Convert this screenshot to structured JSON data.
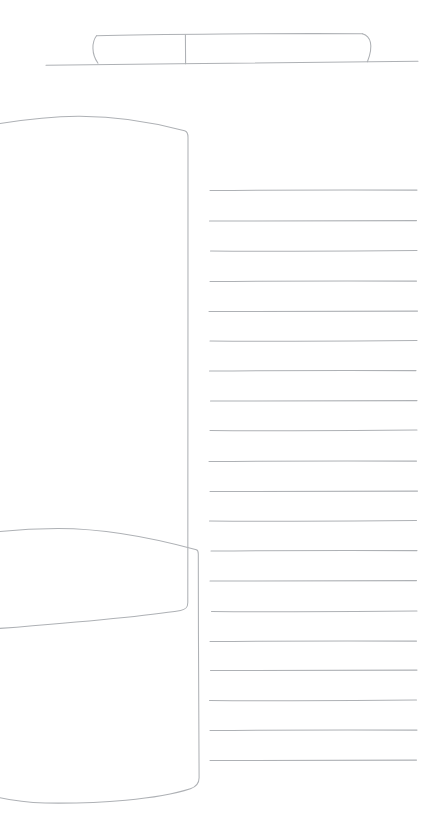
{
  "canvas": {
    "width": 443,
    "height": 840,
    "background": "#ffffff"
  },
  "stroke": {
    "color": "#aeb1b5",
    "width": 1.05
  },
  "sketch": {
    "description": "freehand gray line sketch: divided capsule resting on a baseline, tall curved panel overlapped by a lower curved panel, ruled lines on the right",
    "shapes": [
      {
        "name": "baseline",
        "d": "M 46,65.2 C 170,64 330,62 418,61.3"
      },
      {
        "name": "capsule-top-edge",
        "d": "M 96.5,35.8 C 150,34.3 290,33.2 362.5,33.8"
      },
      {
        "name": "capsule-left-end",
        "d": "M 96.5,35.8 C 91.8,42 91.2,54 98,63.2"
      },
      {
        "name": "capsule-right-end",
        "d": "M 362.5,33.8 C 370.5,36.2 374,45 367.4,61.8"
      },
      {
        "name": "capsule-divider",
        "d": "M 185.4,34.8 L 185.6,63.8"
      },
      {
        "name": "tall-panel",
        "d": "M 0,123.5 C 28,119 56,116.3 78,116.2 C 118,116 159,123.8 184.6,130.8 C 187.2,131.6 188,133.6 188,137.2 C 188.3,290 187.4,470 187.8,602.6 C 187.8,607.8 185.6,609.6 180.6,610.4 C 146,616 58,623.8 0,628.4"
      },
      {
        "name": "lower-panel",
        "d": "M 0,531.5 C 19,529.6 40,528.6 58,528.5 C 110,528.6 163,540.6 196.4,549.8 C 197.9,550.3 198.3,551.4 198.3,554 C 198.4,628 198.6,716 199.1,777.6 C 199.2,783.6 196.3,786.8 190.4,788.8 C 157,799.6 100,803.8 45,803 C 27.5,802.6 12.5,800.6 0,797.8"
      }
    ],
    "ruled_lines": {
      "count": 20,
      "lines": [
        [
          190.5,
          210.0,
          417.0
        ],
        [
          221.0,
          209.5,
          416.5
        ],
        [
          251.0,
          210.5,
          417.0
        ],
        [
          281.5,
          210.0,
          416.5
        ],
        [
          311.5,
          209.0,
          417.5
        ],
        [
          341.0,
          210.0,
          417.0
        ],
        [
          371.0,
          209.5,
          416.0
        ],
        [
          401.0,
          210.5,
          417.0
        ],
        [
          430.5,
          210.0,
          417.0
        ],
        [
          461.5,
          209.0,
          416.5
        ],
        [
          491.5,
          210.0,
          417.5
        ],
        [
          521.0,
          209.5,
          416.5
        ],
        [
          551.0,
          211.0,
          417.0
        ],
        [
          581.0,
          210.0,
          416.5
        ],
        [
          611.5,
          211.5,
          417.0
        ],
        [
          641.5,
          210.0,
          416.5
        ],
        [
          670.5,
          210.5,
          417.0
        ],
        [
          700.5,
          209.5,
          416.5
        ],
        [
          730.5,
          210.0,
          417.0
        ],
        [
          760.5,
          210.0,
          416.5
        ]
      ]
    }
  }
}
